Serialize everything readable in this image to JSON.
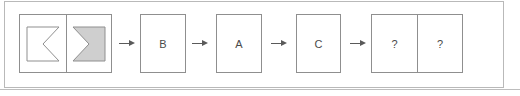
{
  "figure": {
    "type": "sequence-diagram",
    "background_color": "#ffffff",
    "frame_color": "#b9b9b9",
    "box_border_color": "#8f8f8f",
    "text_color": "#4a4a4a",
    "shape_fill_gray": "#cfcfcf",
    "shape_fill_white": "#ffffff",
    "arrow_color": "#5a5a5a"
  },
  "steps": [
    {
      "id": "step-1",
      "kind": "compound",
      "cells": [
        {
          "id": "cell-left-chevron",
          "content_type": "shape",
          "shape": "chevron-left-outline",
          "fill": "#ffffff",
          "label": ""
        },
        {
          "id": "cell-right-chevron",
          "content_type": "shape",
          "shape": "chevron-right-filled",
          "fill": "#cfcfcf",
          "label": ""
        }
      ]
    },
    {
      "id": "step-2",
      "kind": "single",
      "label": "B"
    },
    {
      "id": "step-3",
      "kind": "single",
      "label": "A"
    },
    {
      "id": "step-4",
      "kind": "single",
      "label": "C"
    },
    {
      "id": "step-5",
      "kind": "compound",
      "cells": [
        {
          "id": "cell-unknown-1",
          "content_type": "text",
          "shape": "",
          "fill": "#ffffff",
          "label": "?"
        },
        {
          "id": "cell-unknown-2",
          "content_type": "text",
          "shape": "",
          "fill": "#ffffff",
          "label": "?"
        }
      ]
    }
  ],
  "connectors": [
    {
      "id": "arrow-1",
      "glyph": "arrow-right"
    },
    {
      "id": "arrow-2",
      "glyph": "arrow-right"
    },
    {
      "id": "arrow-3",
      "glyph": "arrow-right"
    },
    {
      "id": "arrow-4",
      "glyph": "arrow-right"
    }
  ]
}
